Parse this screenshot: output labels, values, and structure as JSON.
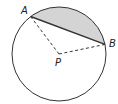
{
  "diagram": {
    "type": "circle-segment",
    "colors": {
      "stroke": "#333333",
      "shade": "#d4d4d4",
      "background": "#ffffff"
    },
    "circle": {
      "cx": 59,
      "cy": 54,
      "r": 47
    },
    "points": {
      "A": {
        "label": "A",
        "x": 30.6,
        "y": 16.5
      },
      "B": {
        "label": "B",
        "x": 105,
        "y": 44.4
      },
      "P": {
        "label": "P",
        "x": 59,
        "y": 54
      }
    },
    "segments": [
      {
        "from": "P",
        "to": "A",
        "style": "dashed"
      },
      {
        "from": "P",
        "to": "B",
        "style": "dashed"
      },
      {
        "from": "A",
        "to": "B",
        "style": "solid"
      }
    ],
    "shaded_region": "minor segment between chord AB and arc AB"
  }
}
